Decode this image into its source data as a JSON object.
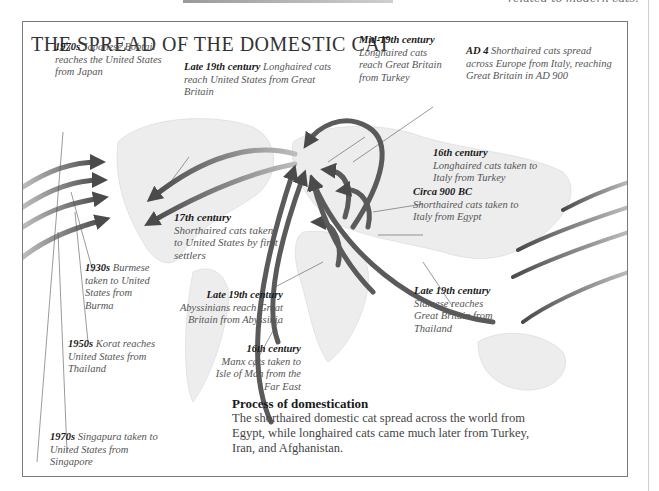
{
  "page": {
    "top_snippet": "related to modern cats."
  },
  "diagram": {
    "title": "THE SPREAD OF THE DOMESTIC CAT",
    "labels": [
      {
        "id": "japanese-bobtail",
        "date": "1970s",
        "text": " Japanese Bobtail reaches the United States from Japan"
      },
      {
        "id": "longhaired-us",
        "date": "Late 19th century",
        "text": " Longhaired cats reach United States from Great Britain"
      },
      {
        "id": "longhaired-gb",
        "date": "Mid-19th century",
        "text": "Longhaired cats reach Great Britain from Turkey"
      },
      {
        "id": "shorthaired-europe",
        "date": "AD 4",
        "text": " Shorthaired cats spread across Europe from Italy, reaching Great Britain in AD 900"
      },
      {
        "id": "longhaired-italy",
        "date": "16th century",
        "text": "Longhaired cats taken to Italy from Turkey"
      },
      {
        "id": "shorthaired-italy",
        "date": "Circa 900 BC",
        "text": "Shorthaired cats taken to Italy from Egypt"
      },
      {
        "id": "shorthaired-us",
        "date": "17th century",
        "text": "Shorthaired cats taken to United States by first settlers"
      },
      {
        "id": "abyssinians",
        "date": "Late 19th century",
        "text": "Abyssinians reach Great Britain from Abyssinia"
      },
      {
        "id": "siamese",
        "date": "Late 19th century",
        "text": "Siamese reaches Great Britain from Thailand"
      },
      {
        "id": "burmese",
        "date": "1930s",
        "text": " Burmese taken to United States from Burma"
      },
      {
        "id": "korat",
        "date": "1950s",
        "text": " Korat reaches United States from Thailand"
      },
      {
        "id": "manx",
        "date": "16th century",
        "text": "Manx cats taken to Isle of Man from the Far East"
      },
      {
        "id": "singapura",
        "date": "1970s",
        "text": " Singapura taken to United States from Singapore"
      }
    ],
    "process": {
      "heading": "Process of domestication",
      "body": "The shorthaired domestic cat spread across the world from Egypt, while longhaired cats came much later from Turkey, Iran, and Afghanistan."
    },
    "colors": {
      "arrow": "#5a5a5a",
      "border": "#7a7a7a",
      "map": "#d8d8d8"
    }
  }
}
